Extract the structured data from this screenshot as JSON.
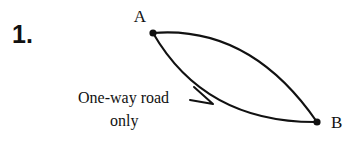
{
  "page": {
    "background_color": "#ffffff",
    "ink_color": "#111111"
  },
  "problem": {
    "number_label": "1."
  },
  "diagram": {
    "type": "directed-graph-lens",
    "nodes": [
      {
        "id": "A",
        "label": "A",
        "x": 153,
        "y": 33,
        "label_x": 140,
        "label_y": 22,
        "radius": 3.6
      },
      {
        "id": "B",
        "label": "B",
        "x": 317,
        "y": 122,
        "label_x": 331,
        "label_y": 128,
        "radius": 3.6
      }
    ],
    "edges": [
      {
        "id": "upper-arc",
        "from": "A",
        "to": "B",
        "bulge": "up-right",
        "has_arrowhead": false
      },
      {
        "id": "lower-arc",
        "from": "A",
        "to": "B",
        "bulge": "down-left",
        "has_arrowhead": true,
        "arrow_tip_x": 213,
        "arrow_tip_y": 104,
        "arrow_direction": "down-right"
      }
    ],
    "caption": {
      "line1": "One-way road",
      "line2": "only",
      "line1_x": 78,
      "line1_y": 103,
      "line2_x": 110,
      "line2_y": 126
    }
  }
}
